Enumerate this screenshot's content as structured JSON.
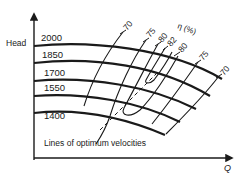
{
  "diagram": {
    "type": "pump performance (iso-efficiency) chart",
    "y_axis_label": "Head",
    "x_axis_label": "Q",
    "efficiency_label": "η (%)",
    "head_curves": [
      {
        "label": "2000"
      },
      {
        "label": "1850"
      },
      {
        "label": "1700"
      },
      {
        "label": "1550"
      },
      {
        "label": "1400"
      }
    ],
    "efficiency_labels": {
      "left_70": "70",
      "left_75": "75",
      "left_80": "80",
      "peak_82": "82",
      "right_80": "80",
      "right_75": "75",
      "right_70": "70"
    },
    "annotation": "Lines of optimum velocities",
    "colors": {
      "ink": "#1a1a1a",
      "background": "#ffffff"
    }
  }
}
